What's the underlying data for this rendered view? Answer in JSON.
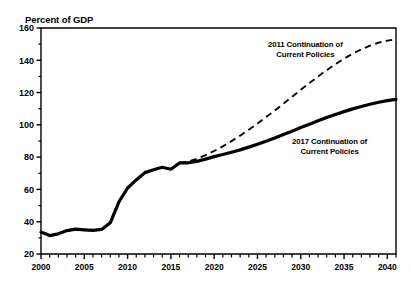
{
  "header": {
    "partial_title": ""
  },
  "axis": {
    "y_axis_title": "Percent of GDP",
    "y_ticks": [
      20,
      40,
      60,
      80,
      100,
      120,
      140,
      160
    ],
    "y_minor_ticks": [
      30,
      50,
      70,
      90,
      110,
      130,
      150
    ],
    "x_ticks": [
      2000,
      2005,
      2010,
      2015,
      2020,
      2025,
      2030,
      2035,
      2040
    ]
  },
  "annotations": {
    "dashed": {
      "line1": "2011 Continuation of",
      "line2": "Current Policies"
    },
    "solid": {
      "line1": "2017 Continuation of",
      "line2": "Current Policies"
    }
  },
  "colors": {
    "ink": "#000000",
    "background": "#ffffff"
  },
  "chart_data": {
    "type": "line",
    "title": "",
    "xlabel": "",
    "ylabel": "Percent of GDP",
    "xlim": [
      2000,
      2041
    ],
    "ylim": [
      20,
      160
    ],
    "grid": false,
    "legend": "annotations-inline",
    "x": [
      2000,
      2001,
      2002,
      2003,
      2004,
      2005,
      2006,
      2007,
      2008,
      2009,
      2010,
      2011,
      2012,
      2013,
      2014,
      2015,
      2016,
      2017,
      2018,
      2019,
      2020,
      2021,
      2022,
      2023,
      2024,
      2025,
      2026,
      2027,
      2028,
      2029,
      2030,
      2031,
      2032,
      2033,
      2034,
      2035,
      2036,
      2037,
      2038,
      2039,
      2040,
      2041
    ],
    "series": [
      {
        "name": "2017 Continuation of Current Policies",
        "style": "solid",
        "values": [
          33.6,
          31.4,
          32.5,
          34.5,
          35.4,
          35.0,
          34.6,
          35.2,
          39.3,
          52.3,
          60.9,
          65.9,
          70.4,
          72.2,
          73.7,
          72.5,
          76.4,
          76.5,
          77.4,
          78.8,
          80.3,
          81.6,
          83.0,
          84.5,
          86.2,
          88.0,
          89.9,
          91.9,
          94.0,
          96.1,
          98.3,
          100.4,
          102.5,
          104.5,
          106.4,
          108.2,
          109.9,
          111.4,
          112.8,
          114.0,
          115.0,
          115.8
        ]
      },
      {
        "name": "2011 Continuation of Current Policies",
        "style": "dashed",
        "values": [
          null,
          null,
          null,
          null,
          null,
          null,
          null,
          null,
          null,
          null,
          null,
          null,
          null,
          null,
          null,
          null,
          76.4,
          77.2,
          79.0,
          81.2,
          83.8,
          86.7,
          89.9,
          93.3,
          97.0,
          100.8,
          104.8,
          108.9,
          113.1,
          117.4,
          121.7,
          125.9,
          130.0,
          133.9,
          137.6,
          141.0,
          144.1,
          146.8,
          149.1,
          150.9,
          152.2,
          153.0
        ]
      }
    ]
  }
}
